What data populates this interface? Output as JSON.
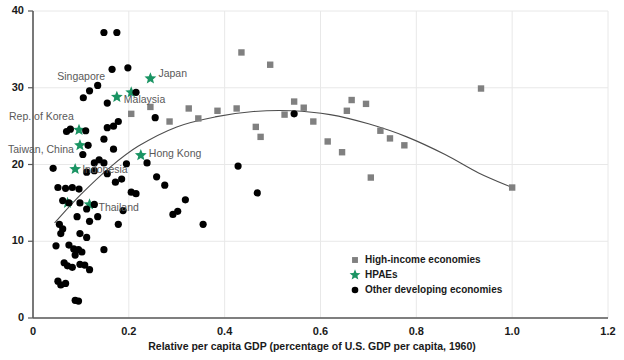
{
  "chart_data": {
    "type": "scatter",
    "title": "",
    "xlabel": "Relative per capita GDP (percentage of U.S. GDP per capita, 1960)",
    "ylabel": "",
    "xlim": [
      0,
      1.2
    ],
    "ylim": [
      0,
      40
    ],
    "xticks": [
      "0",
      "0.2",
      "0.4",
      "0.6",
      "0.8",
      "1.0",
      "1.2"
    ],
    "xtick_values": [
      0,
      0.2,
      0.4,
      0.6,
      0.8,
      1.0,
      1.2
    ],
    "yticks": [
      "0",
      "10",
      "20",
      "30",
      "40"
    ],
    "ytick_values": [
      0,
      10,
      20,
      30,
      40
    ],
    "grid": true,
    "legend_position": "bottom-right",
    "colors": {
      "high_income": "#808080",
      "hpae": "#1a9463",
      "other_developing": "#000000",
      "curve": "#4d4d4d",
      "axis": "#595959",
      "grid": "#e8e8e8",
      "label_text": "#595959"
    },
    "series": [
      {
        "name": "High-income economies",
        "marker": "square",
        "color": "#808080",
        "points": [
          [
            0.205,
            26.6
          ],
          [
            0.245,
            27.5
          ],
          [
            0.285,
            25.6
          ],
          [
            0.325,
            27.3
          ],
          [
            0.345,
            26.0
          ],
          [
            0.385,
            27.0
          ],
          [
            0.425,
            27.3
          ],
          [
            0.435,
            34.6
          ],
          [
            0.465,
            24.9
          ],
          [
            0.475,
            23.6
          ],
          [
            0.495,
            33.0
          ],
          [
            0.525,
            26.5
          ],
          [
            0.545,
            28.2
          ],
          [
            0.565,
            27.4
          ],
          [
            0.585,
            25.6
          ],
          [
            0.615,
            23.0
          ],
          [
            0.645,
            21.6
          ],
          [
            0.655,
            27.0
          ],
          [
            0.665,
            28.4
          ],
          [
            0.695,
            27.9
          ],
          [
            0.705,
            18.3
          ],
          [
            0.725,
            24.4
          ],
          [
            0.745,
            23.4
          ],
          [
            0.775,
            22.5
          ],
          [
            0.935,
            29.9
          ],
          [
            1.0,
            17.0
          ]
        ]
      },
      {
        "name": "HPAEs",
        "marker": "star",
        "color": "#1a9463",
        "points": [
          [
            0.072,
            15.0
          ],
          [
            0.088,
            19.4
          ],
          [
            0.096,
            24.5
          ],
          [
            0.098,
            22.5
          ],
          [
            0.118,
            14.8
          ],
          [
            0.175,
            28.8
          ],
          [
            0.205,
            29.4
          ],
          [
            0.225,
            21.2
          ],
          [
            0.245,
            31.2
          ]
        ],
        "labels": [
          {
            "name": "Singapore",
            "x": 0.205,
            "y": 29.4
          },
          {
            "name": "Japan",
            "x": 0.245,
            "y": 31.2
          },
          {
            "name": "Malaysia",
            "x": 0.175,
            "y": 28.8
          },
          {
            "name": "Rep. of Korea",
            "x": 0.096,
            "y": 24.5
          },
          {
            "name": "Taiwan, China",
            "x": 0.098,
            "y": 22.5
          },
          {
            "name": "Hong Kong",
            "x": 0.225,
            "y": 21.2
          },
          {
            "name": "Indonesia",
            "x": 0.088,
            "y": 19.4
          },
          {
            "name": "Thailand",
            "x": 0.118,
            "y": 14.8
          }
        ]
      },
      {
        "name": "Other developing economies",
        "marker": "circle",
        "color": "#000000",
        "points": [
          [
            0.148,
            37.2
          ],
          [
            0.175,
            37.2
          ],
          [
            0.165,
            32.4
          ],
          [
            0.198,
            32.6
          ],
          [
            0.118,
            29.6
          ],
          [
            0.135,
            30.3
          ],
          [
            0.105,
            28.7
          ],
          [
            0.155,
            28.0
          ],
          [
            0.215,
            29.4
          ],
          [
            0.178,
            25.6
          ],
          [
            0.155,
            24.8
          ],
          [
            0.168,
            25.0
          ],
          [
            0.07,
            24.3
          ],
          [
            0.078,
            24.6
          ],
          [
            0.11,
            24.4
          ],
          [
            0.148,
            23.3
          ],
          [
            0.115,
            22.5
          ],
          [
            0.168,
            22.0
          ],
          [
            0.104,
            21.3
          ],
          [
            0.138,
            20.6
          ],
          [
            0.128,
            20.2
          ],
          [
            0.148,
            20.2
          ],
          [
            0.195,
            20.1
          ],
          [
            0.238,
            20.2
          ],
          [
            0.042,
            19.5
          ],
          [
            0.112,
            19.0
          ],
          [
            0.128,
            19.2
          ],
          [
            0.155,
            18.8
          ],
          [
            0.172,
            17.7
          ],
          [
            0.185,
            18.1
          ],
          [
            0.052,
            17.0
          ],
          [
            0.068,
            16.9
          ],
          [
            0.082,
            17.0
          ],
          [
            0.096,
            16.8
          ],
          [
            0.205,
            16.4
          ],
          [
            0.215,
            16.2
          ],
          [
            0.062,
            15.3
          ],
          [
            0.075,
            15.0
          ],
          [
            0.098,
            15.0
          ],
          [
            0.128,
            14.8
          ],
          [
            0.112,
            14.2
          ],
          [
            0.188,
            14.0
          ],
          [
            0.092,
            13.2
          ],
          [
            0.118,
            12.6
          ],
          [
            0.135,
            13.2
          ],
          [
            0.178,
            12.2
          ],
          [
            0.055,
            12.2
          ],
          [
            0.062,
            11.6
          ],
          [
            0.058,
            11.0
          ],
          [
            0.098,
            11.0
          ],
          [
            0.112,
            10.5
          ],
          [
            0.048,
            9.4
          ],
          [
            0.075,
            9.5
          ],
          [
            0.085,
            9.0
          ],
          [
            0.095,
            8.9
          ],
          [
            0.102,
            8.6
          ],
          [
            0.088,
            8.2
          ],
          [
            0.148,
            8.9
          ],
          [
            0.065,
            7.2
          ],
          [
            0.072,
            6.8
          ],
          [
            0.082,
            6.6
          ],
          [
            0.098,
            7.0
          ],
          [
            0.108,
            6.9
          ],
          [
            0.118,
            6.3
          ],
          [
            0.052,
            4.8
          ],
          [
            0.058,
            4.3
          ],
          [
            0.068,
            4.5
          ],
          [
            0.088,
            2.3
          ],
          [
            0.095,
            2.2
          ],
          [
            0.258,
            18.4
          ],
          [
            0.275,
            17.3
          ],
          [
            0.318,
            15.4
          ],
          [
            0.355,
            12.2
          ],
          [
            0.255,
            26.1
          ],
          [
            0.428,
            19.8
          ],
          [
            0.468,
            16.3
          ],
          [
            0.292,
            13.5
          ],
          [
            0.302,
            13.9
          ],
          [
            0.545,
            26.6
          ]
        ]
      }
    ],
    "trend_curve": {
      "description": "fitted quadratic trend line",
      "points": [
        [
          0.045,
          12.4
        ],
        [
          0.1,
          16.1
        ],
        [
          0.16,
          19.6
        ],
        [
          0.22,
          22.4
        ],
        [
          0.3,
          24.9
        ],
        [
          0.38,
          26.2
        ],
        [
          0.46,
          26.9
        ],
        [
          0.54,
          27.0
        ],
        [
          0.62,
          26.5
        ],
        [
          0.7,
          25.3
        ],
        [
          0.78,
          23.6
        ],
        [
          0.86,
          21.3
        ],
        [
          0.93,
          18.9
        ],
        [
          1.0,
          17.0
        ]
      ]
    },
    "legend": [
      {
        "label": "High-income economies",
        "marker": "square",
        "color": "#808080"
      },
      {
        "label": "HPAEs",
        "marker": "star",
        "color": "#1a9463"
      },
      {
        "label": "Other developing economies",
        "marker": "circle",
        "color": "#000000"
      }
    ]
  }
}
